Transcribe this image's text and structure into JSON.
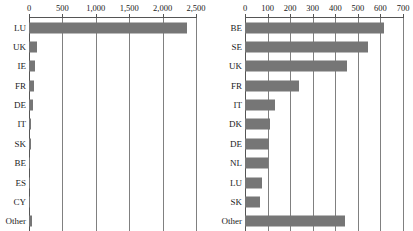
{
  "chart_data": [
    {
      "id": "left",
      "type": "bar",
      "orientation": "horizontal",
      "title": "",
      "xlabel": "",
      "ylabel": "",
      "xlim": [
        0,
        2500
      ],
      "grid": true,
      "legend": "none",
      "xticks": [
        0,
        500,
        1000,
        1500,
        2000,
        2500
      ],
      "xticklabels": [
        "0",
        "500",
        "1,000",
        "1,500",
        "2,000",
        "2,500"
      ],
      "categories": [
        "LU",
        "UK",
        "IE",
        "FR",
        "DE",
        "IT",
        "SK",
        "BE",
        "ES",
        "CY",
        "Other"
      ],
      "values": [
        2370,
        115,
        95,
        70,
        60,
        30,
        25,
        22,
        20,
        18,
        40
      ],
      "bar_color": "#767676"
    },
    {
      "id": "right",
      "type": "bar",
      "orientation": "horizontal",
      "title": "",
      "xlabel": "",
      "ylabel": "",
      "xlim": [
        0,
        700
      ],
      "grid": true,
      "legend": "none",
      "xticks": [
        0,
        100,
        200,
        300,
        400,
        500,
        600,
        700
      ],
      "xticklabels": [
        "0",
        "100",
        "200",
        "300",
        "400",
        "500",
        "600",
        "700"
      ],
      "categories": [
        "BE",
        "SE",
        "UK",
        "FR",
        "IT",
        "DK",
        "DE",
        "NL",
        "LU",
        "SK",
        "Other"
      ],
      "values": [
        615,
        545,
        450,
        240,
        135,
        110,
        105,
        100,
        75,
        65,
        445
      ],
      "bar_color": "#767676"
    }
  ]
}
